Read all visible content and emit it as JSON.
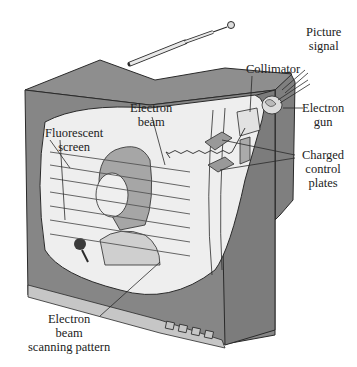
{
  "figure": {
    "labels": {
      "picture_signal": [
        "Picture",
        "signal"
      ],
      "collimator": "Collimator",
      "electron_gun": [
        "Electron",
        "gun"
      ],
      "electron_beam": [
        "Electron",
        "beam"
      ],
      "fluorescent_screen": [
        "Fluorescent",
        "screen"
      ],
      "charged_control_plates": [
        "Charged",
        "control",
        "plates"
      ],
      "scanning_pattern": [
        "Electron",
        "beam",
        "scanning pattern"
      ]
    }
  },
  "colors": {
    "cabinet": "#8a8a8a",
    "cabinet_dark": "#7a7a7a",
    "cabinet_top": "#939393",
    "screen": "#eeeeee",
    "base_strip": "#c4c4c4",
    "outline": "#2a2a2a"
  }
}
